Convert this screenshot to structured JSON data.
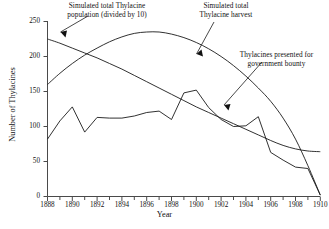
{
  "chart_data": {
    "type": "line",
    "title": "",
    "xlabel": "Year",
    "ylabel": "Number of Thylacines",
    "xlim": [
      1888,
      1910
    ],
    "ylim": [
      0,
      250
    ],
    "yticks": [
      0,
      50,
      100,
      150,
      200,
      250
    ],
    "xticks": [
      1888,
      1890,
      1892,
      1894,
      1896,
      1898,
      1900,
      1902,
      1904,
      1906,
      1908,
      1910
    ],
    "x_minor_tick_step": 1,
    "grid": false,
    "legend_position": "none",
    "line_color": "#1a1a1a",
    "background_color": "#ffffff",
    "x": [
      1888,
      1889,
      1890,
      1891,
      1892,
      1893,
      1894,
      1895,
      1896,
      1897,
      1898,
      1899,
      1900,
      1901,
      1902,
      1903,
      1904,
      1905,
      1906,
      1907,
      1908,
      1909,
      1910
    ],
    "series": [
      {
        "name": "Simulated total Thylacine population (divided by 10)",
        "style": "smooth",
        "values": [
          225,
          219,
          212,
          205,
          198,
          190,
          182,
          173,
          164,
          155,
          146,
          137,
          128,
          120,
          112,
          104,
          96,
          88,
          80,
          73,
          68,
          65,
          64
        ]
      },
      {
        "name": "Simulated total Thylacine harvest",
        "style": "smooth",
        "values": [
          160,
          176,
          190,
          202,
          212,
          221,
          228,
          233,
          235,
          235,
          232,
          227,
          220,
          211,
          200,
          187,
          172,
          155,
          136,
          112,
          82,
          44,
          2
        ]
      },
      {
        "name": "Thylacines presented for government bounty",
        "style": "jagged",
        "values": [
          82,
          108,
          128,
          92,
          113,
          112,
          112,
          115,
          120,
          122,
          110,
          148,
          152,
          127,
          110,
          100,
          101,
          114,
          63,
          52,
          42,
          40,
          2
        ]
      }
    ],
    "annotations": [
      {
        "name": "population-annotation",
        "lines": [
          "Simulated total Thylacine",
          "population (divided by 10)"
        ],
        "points_to": {
          "x": 1889,
          "y": 220
        }
      },
      {
        "name": "harvest-annotation",
        "lines": [
          "Simulated total",
          "Thylacine harvest"
        ],
        "points_to": {
          "x": 1900,
          "y": 200
        }
      },
      {
        "name": "bounty-annotation",
        "lines": [
          "Thylacines presented for",
          "government bounty"
        ],
        "points_to": {
          "x": 1902.4,
          "y": 122
        }
      }
    ]
  }
}
